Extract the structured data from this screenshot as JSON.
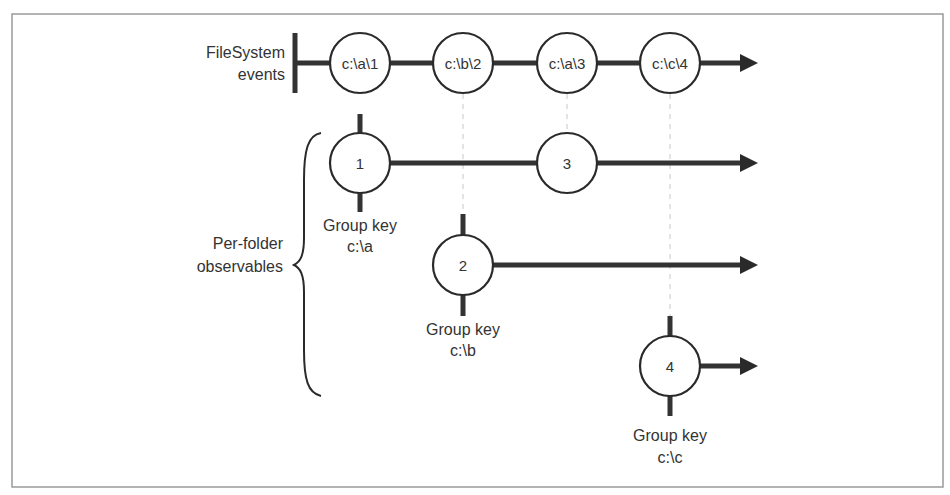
{
  "diagram": {
    "source_label": {
      "line1": "FileSystem",
      "line2": "events"
    },
    "source_events": [
      {
        "label": "c:\\a\\1",
        "x": 360
      },
      {
        "label": "c:\\b\\2",
        "x": 463
      },
      {
        "label": "c:\\a\\3",
        "x": 567
      },
      {
        "label": "c:\\c\\4",
        "x": 670
      }
    ],
    "group_label": {
      "line1": "Per-folder",
      "line2": "observables"
    },
    "groups": [
      {
        "key_caption": "Group key",
        "key": "c:\\a",
        "events": [
          {
            "label": "1",
            "x": 360
          },
          {
            "label": "3",
            "x": 567
          }
        ]
      },
      {
        "key_caption": "Group key",
        "key": "c:\\b",
        "events": [
          {
            "label": "2",
            "x": 463
          }
        ]
      },
      {
        "key_caption": "Group key",
        "key": "c:\\c",
        "events": [
          {
            "label": "4",
            "x": 670
          }
        ]
      }
    ],
    "colors": {
      "stroke": "#333333",
      "frame": "#9a9a9a",
      "guide": "#c8c8c8",
      "background": "#ffffff"
    }
  }
}
